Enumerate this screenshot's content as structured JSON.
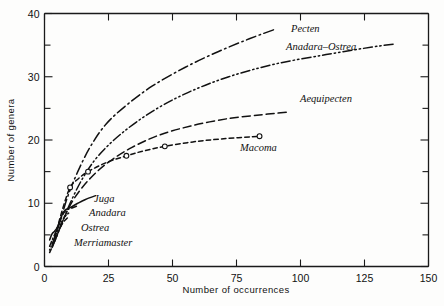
{
  "chart_data": {
    "type": "line",
    "title": "",
    "xlabel": "Number of occurrences",
    "ylabel": "Number of genera",
    "xlim": [
      0,
      150
    ],
    "ylim": [
      0,
      40
    ],
    "grid": false,
    "legend_position": "inline-curve-labels",
    "x_ticks_major": [
      0,
      25,
      50,
      75,
      100,
      125,
      150
    ],
    "x_ticks_minor": [],
    "y_ticks_major": [
      0,
      10,
      20,
      30,
      40
    ],
    "y_ticks_minor": [
      5,
      15,
      25,
      35
    ],
    "x_tick_labels": [
      "0",
      "25",
      "50",
      "75",
      "100",
      "125",
      "150"
    ],
    "y_tick_labels": [
      "0",
      "10",
      "20",
      "30",
      "40"
    ],
    "series": [
      {
        "name": "Pecten",
        "line_style": "dash-dot",
        "markers": false,
        "points": [
          [
            3,
            3.5
          ],
          [
            6,
            7
          ],
          [
            9,
            11
          ],
          [
            13,
            15
          ],
          [
            18,
            19
          ],
          [
            24,
            22.5
          ],
          [
            32,
            25.5
          ],
          [
            42,
            28.5
          ],
          [
            55,
            31.5
          ],
          [
            68,
            34
          ],
          [
            80,
            36
          ],
          [
            90,
            37.5
          ]
        ]
      },
      {
        "name": "Anadara-Ostrea",
        "line_style": "dash-dot-dot",
        "markers": false,
        "points": [
          [
            3,
            3
          ],
          [
            6,
            6
          ],
          [
            10,
            10
          ],
          [
            15,
            14
          ],
          [
            21,
            17.5
          ],
          [
            30,
            21
          ],
          [
            42,
            24.5
          ],
          [
            56,
            27.5
          ],
          [
            72,
            30
          ],
          [
            90,
            32
          ],
          [
            110,
            33.5
          ],
          [
            128,
            34.7
          ],
          [
            137,
            35.2
          ]
        ]
      },
      {
        "name": "Aequipecten",
        "line_style": "long-dash",
        "markers": false,
        "points": [
          [
            4,
            4
          ],
          [
            8,
            8
          ],
          [
            12,
            11
          ],
          [
            18,
            14
          ],
          [
            25,
            16.5
          ],
          [
            34,
            18.8
          ],
          [
            45,
            20.8
          ],
          [
            58,
            22.3
          ],
          [
            72,
            23.4
          ],
          [
            85,
            24
          ],
          [
            95,
            24.4
          ]
        ]
      },
      {
        "name": "Macoma",
        "line_style": "short-dash",
        "markers": true,
        "marker_style": "open-circle",
        "marker_points": [
          [
            10,
            12.5
          ],
          [
            17,
            15
          ],
          [
            32,
            17.5
          ],
          [
            47,
            19
          ],
          [
            84,
            20.6
          ]
        ],
        "points": [
          [
            4,
            4.5
          ],
          [
            7,
            9
          ],
          [
            10,
            12.5
          ],
          [
            13,
            13.8
          ],
          [
            17,
            15
          ],
          [
            24,
            16.4
          ],
          [
            32,
            17.5
          ],
          [
            39,
            18.3
          ],
          [
            47,
            19
          ],
          [
            58,
            19.7
          ],
          [
            70,
            20.2
          ],
          [
            84,
            20.6
          ]
        ]
      },
      {
        "name": "Juga",
        "line_style": "solid",
        "markers": false,
        "points": [
          [
            2,
            4.2
          ],
          [
            3,
            5.2
          ],
          [
            4,
            5.6
          ],
          [
            5,
            6.2
          ],
          [
            6,
            7.2
          ],
          [
            7,
            8.3
          ],
          [
            8,
            8.9
          ],
          [
            10,
            9.3
          ],
          [
            13,
            10
          ],
          [
            16,
            10.6
          ],
          [
            20,
            11.2
          ]
        ]
      },
      {
        "name": "Anadara",
        "line_style": "dash-dot-short",
        "markers": false,
        "points": [
          [
            2,
            3.2
          ],
          [
            3,
            4.2
          ],
          [
            4,
            5.1
          ],
          [
            5,
            6.1
          ],
          [
            6,
            7.2
          ],
          [
            7,
            8.1
          ],
          [
            8,
            8.7
          ],
          [
            9,
            9
          ],
          [
            11,
            9.3
          ],
          [
            13,
            9.6
          ]
        ]
      },
      {
        "name": "Ostrea",
        "line_style": "dotted",
        "markers": false,
        "points": [
          [
            2,
            2.6
          ],
          [
            3,
            3.6
          ],
          [
            4,
            4.6
          ],
          [
            5,
            5.6
          ],
          [
            6,
            6.5
          ],
          [
            7,
            7.3
          ],
          [
            8,
            7.9
          ],
          [
            9,
            8.3
          ],
          [
            10,
            8.6
          ]
        ]
      },
      {
        "name": "Merriamaster",
        "line_style": "dash",
        "markers": false,
        "points": [
          [
            2,
            2.2
          ],
          [
            3,
            3.1
          ],
          [
            4,
            4.1
          ],
          [
            5,
            5.1
          ],
          [
            6,
            6
          ],
          [
            7,
            6.8
          ],
          [
            8,
            7.3
          ],
          [
            9,
            7.7
          ]
        ]
      }
    ],
    "annotations": [
      {
        "text": "Pecten",
        "x_px": 291,
        "y_px": 32,
        "anchor": "start"
      },
      {
        "text": "Anadara–Ostrea",
        "x_px": 286,
        "y_px": 50,
        "anchor": "start"
      },
      {
        "text": "Aequipecten",
        "x_px": 300,
        "y_px": 102,
        "anchor": "start"
      },
      {
        "text": "Macoma",
        "x_px": 240,
        "y_px": 151,
        "anchor": "start"
      },
      {
        "text": "Juga",
        "x_px": 94,
        "y_px": 202,
        "anchor": "start"
      },
      {
        "text": "Anadara",
        "x_px": 89,
        "y_px": 216,
        "anchor": "start"
      },
      {
        "text": "Ostrea",
        "x_px": 81,
        "y_px": 231,
        "anchor": "start"
      },
      {
        "text": "Merriamaster",
        "x_px": 74,
        "y_px": 246,
        "anchor": "start"
      }
    ]
  }
}
